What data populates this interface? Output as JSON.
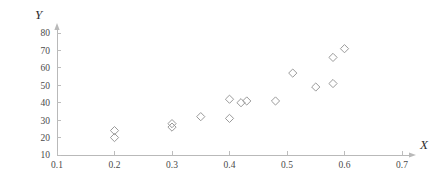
{
  "chart_data": {
    "type": "scatter",
    "title": "",
    "xlabel": "X",
    "ylabel": "Y",
    "xlim": [
      0.1,
      0.7
    ],
    "ylim": [
      10,
      80
    ],
    "grid": false,
    "legend": null,
    "marker_style": "open-diamond",
    "marker_color": "#9a9a9a",
    "axis_color": "#b9b9b9",
    "xticks": [
      "0.1",
      "0.2",
      "0.3",
      "0.4",
      "0.5",
      "0.6",
      "0.7"
    ],
    "xtick_values": [
      0.1,
      0.2,
      0.3,
      0.4,
      0.5,
      0.6,
      0.7
    ],
    "yticks": [
      "10",
      "20",
      "30",
      "40",
      "50",
      "60",
      "70",
      "80"
    ],
    "ytick_values": [
      10,
      20,
      30,
      40,
      50,
      60,
      70,
      80
    ],
    "points": [
      {
        "x": 0.2,
        "y": 24
      },
      {
        "x": 0.2,
        "y": 20
      },
      {
        "x": 0.3,
        "y": 28
      },
      {
        "x": 0.3,
        "y": 26
      },
      {
        "x": 0.35,
        "y": 32
      },
      {
        "x": 0.4,
        "y": 42
      },
      {
        "x": 0.4,
        "y": 31
      },
      {
        "x": 0.42,
        "y": 40
      },
      {
        "x": 0.43,
        "y": 41
      },
      {
        "x": 0.48,
        "y": 41
      },
      {
        "x": 0.51,
        "y": 57
      },
      {
        "x": 0.55,
        "y": 49
      },
      {
        "x": 0.58,
        "y": 66
      },
      {
        "x": 0.58,
        "y": 51
      },
      {
        "x": 0.6,
        "y": 71
      }
    ],
    "n_points": 15
  }
}
